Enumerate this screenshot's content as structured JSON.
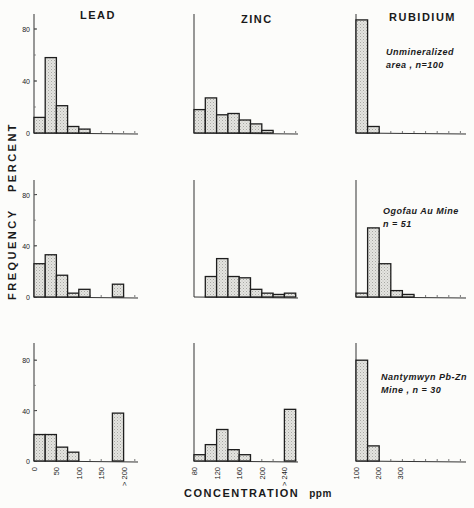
{
  "chart_data": {
    "type": "bar",
    "title": "",
    "ylabel": "FREQUENCY PERCENT",
    "xlabel": "CONCENTRATION ppm",
    "columns": [
      "LEAD",
      "ZINC",
      "RUBIDIUM"
    ],
    "rows": [
      {
        "label": "Unmineralized area , n=100"
      },
      {
        "label": "Ogofau Au Mine n=51"
      },
      {
        "label": "Nantymwyn Pb-Zn Mine , n=30"
      }
    ],
    "ylim": [
      0,
      90
    ],
    "yticks": [
      0,
      40,
      80
    ],
    "panels": [
      {
        "element": "LEAD",
        "row": 0,
        "bin_width": 25,
        "x_start": 0,
        "values": [
          12,
          58,
          21,
          5,
          3
        ]
      },
      {
        "element": "ZINC",
        "row": 0,
        "bin_width": 20,
        "x_start": 80,
        "values": [
          18,
          27,
          14,
          15,
          10,
          7,
          2
        ]
      },
      {
        "element": "RUBIDIUM",
        "row": 0,
        "bin_width": 50,
        "x_start": 100,
        "values": [
          87,
          5
        ]
      },
      {
        "element": "LEAD",
        "row": 1,
        "bin_width": 25,
        "x_start": 0,
        "values": [
          26,
          33,
          17,
          3,
          6,
          0,
          0,
          10
        ]
      },
      {
        "element": "ZINC",
        "row": 1,
        "bin_width": 20,
        "x_start": 80,
        "values": [
          0,
          16,
          30,
          16,
          15,
          6,
          3,
          2,
          3
        ]
      },
      {
        "element": "RUBIDIUM",
        "row": 1,
        "bin_width": 50,
        "x_start": 100,
        "values": [
          3,
          54,
          26,
          5,
          2
        ]
      },
      {
        "element": "LEAD",
        "row": 2,
        "bin_width": 25,
        "x_start": 0,
        "values": [
          21,
          21,
          11,
          7,
          0,
          0,
          0,
          38
        ]
      },
      {
        "element": "ZINC",
        "row": 2,
        "bin_width": 20,
        "x_start": 80,
        "values": [
          5,
          13,
          25,
          9,
          5,
          0,
          0,
          0,
          41
        ]
      },
      {
        "element": "RUBIDIUM",
        "row": 2,
        "bin_width": 50,
        "x_start": 100,
        "values": [
          80,
          12
        ]
      }
    ],
    "xticks": {
      "LEAD": [
        "0",
        "50",
        "100",
        "150",
        "> 200"
      ],
      "ZINC": [
        "80",
        "120",
        "160",
        "200",
        "> 240"
      ],
      "RUBIDIUM": [
        "100",
        "200",
        "300"
      ]
    },
    "grid": false,
    "legend": null
  },
  "labels": {
    "col_lead": "LEAD",
    "col_zinc": "ZINC",
    "col_rubidium": "RUBIDIUM",
    "row1_line1": "Unmineralized",
    "row1_line2": "area , n=100",
    "row2_line1": "Ogofau Au Mine",
    "row2_line2": "n = 51",
    "row3_line1": "Nantymwyn Pb-Zn",
    "row3_line2": "Mine , n = 30",
    "ylabel": "FREQUENCY   PERCENT",
    "xlabel": "CONCENTRATION",
    "xunit": "ppm"
  }
}
